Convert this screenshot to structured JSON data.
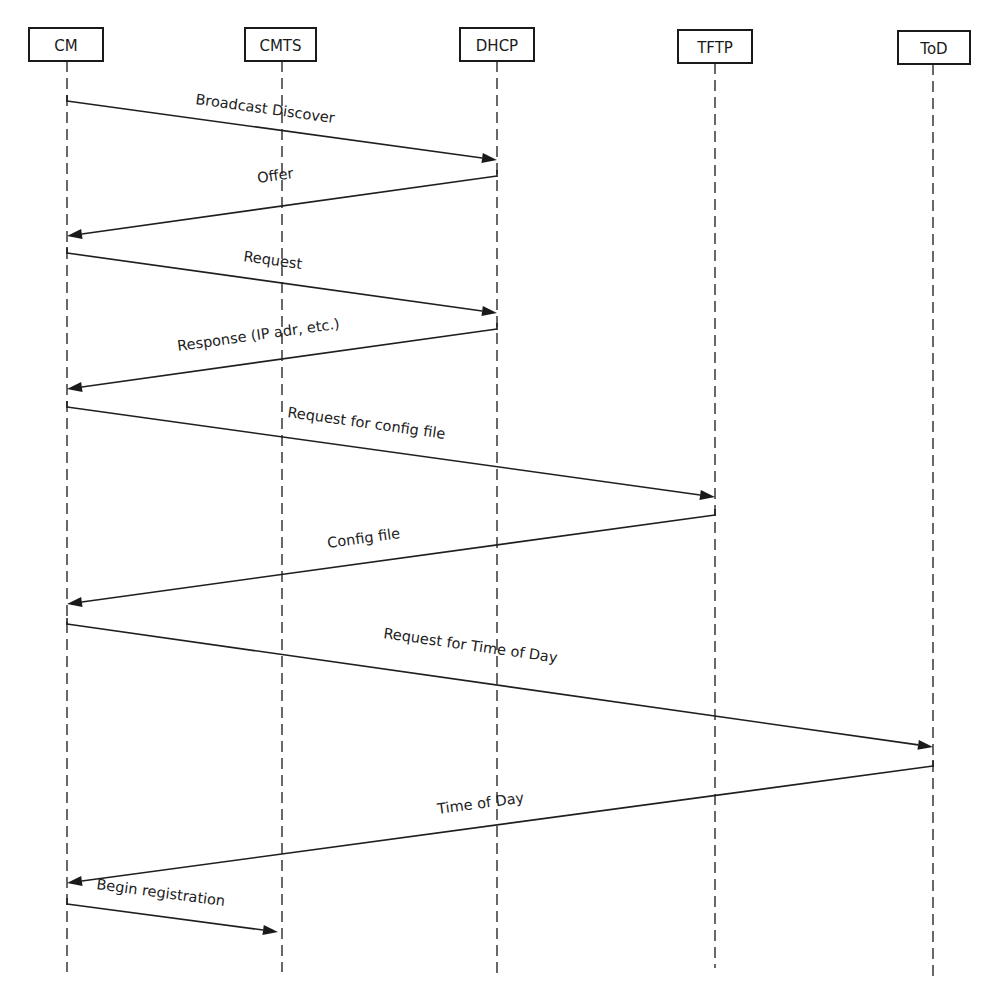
{
  "diagram": {
    "type": "sequence",
    "participants": [
      {
        "id": "cm",
        "label": "CM",
        "box": {
          "x": 29,
          "y": 28,
          "w": 74,
          "h": 33
        },
        "lifeline_x": 67,
        "lifeline_end": 972
      },
      {
        "id": "cmts",
        "label": "CMTS",
        "box": {
          "x": 245,
          "y": 28,
          "w": 71,
          "h": 33
        },
        "lifeline_x": 282,
        "lifeline_end": 972
      },
      {
        "id": "dhcp",
        "label": "DHCP",
        "box": {
          "x": 460,
          "y": 28,
          "w": 74,
          "h": 33
        },
        "lifeline_x": 497,
        "lifeline_end": 974
      },
      {
        "id": "tftp",
        "label": "TFTP",
        "box": {
          "x": 678,
          "y": 30,
          "w": 74,
          "h": 33
        },
        "lifeline_x": 715,
        "lifeline_end": 968
      },
      {
        "id": "tod",
        "label": "ToD",
        "box": {
          "x": 898,
          "y": 31,
          "w": 72,
          "h": 33
        },
        "lifeline_x": 933,
        "lifeline_end": 977
      }
    ],
    "messages": [
      {
        "from": "CM",
        "to": "DHCP",
        "label": "Broadcast Discover",
        "x1": 67,
        "y1": 101,
        "x2": 497,
        "y2": 160
      },
      {
        "from": "DHCP",
        "to": "CM",
        "label": "Offer",
        "x1": 497,
        "y1": 176,
        "x2": 67,
        "y2": 236
      },
      {
        "from": "CM",
        "to": "DHCP",
        "label": "Request",
        "x1": 67,
        "y1": 253,
        "x2": 497,
        "y2": 313
      },
      {
        "from": "DHCP",
        "to": "CM",
        "label": "Response (IP adr, etc.)",
        "x1": 497,
        "y1": 329,
        "x2": 67,
        "y2": 389
      },
      {
        "from": "CM",
        "to": "TFTP",
        "label": "Request for config file",
        "x1": 67,
        "y1": 407,
        "x2": 715,
        "y2": 497
      },
      {
        "from": "TFTP",
        "to": "CM",
        "label": "Config file",
        "x1": 715,
        "y1": 515,
        "x2": 67,
        "y2": 604
      },
      {
        "from": "CM",
        "to": "ToD",
        "label": "Request for Time of Day",
        "x1": 67,
        "y1": 624,
        "x2": 933,
        "y2": 747
      },
      {
        "from": "ToD",
        "to": "CM",
        "label": "Time of Day",
        "x1": 933,
        "y1": 766,
        "x2": 67,
        "y2": 883
      },
      {
        "from": "CM",
        "to": "CMTS",
        "label": "Begin registration",
        "x1": 67,
        "y1": 904,
        "x2": 278,
        "y2": 932
      }
    ],
    "label_positions": [
      {
        "x": 195,
        "y": 104
      },
      {
        "x": 258,
        "y": 183
      },
      {
        "x": 243,
        "y": 261
      },
      {
        "x": 178,
        "y": 351
      },
      {
        "x": 287,
        "y": 417
      },
      {
        "x": 328,
        "y": 548
      },
      {
        "x": 383,
        "y": 638
      },
      {
        "x": 438,
        "y": 814
      },
      {
        "x": 96,
        "y": 889
      }
    ]
  }
}
